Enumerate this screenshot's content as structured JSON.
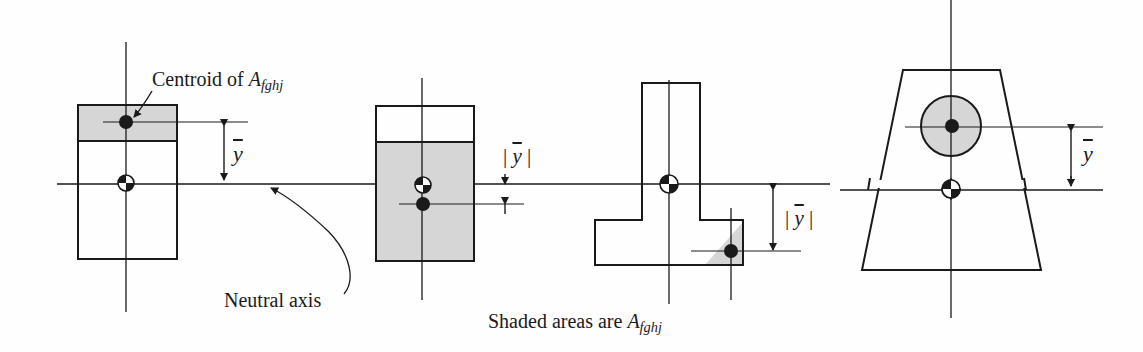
{
  "figure": {
    "caption": {
      "prefix": "Shaded areas are ",
      "symbol": "A",
      "subscript": "fghj"
    },
    "labels": {
      "centroid": {
        "prefix": "Centroid of ",
        "symbol": "A",
        "subscript": "fghj"
      },
      "neutral_axis": "Neutral axis",
      "ybar": "y",
      "abs_open": "|",
      "abs_close": "|"
    },
    "panels": [
      {
        "id": "rectangle-top-shaded",
        "shape": "rectangle",
        "shaded_region": "top strip",
        "dimension_label": "ȳ",
        "absolute": false
      },
      {
        "id": "rectangle-bottom-shaded",
        "shape": "rectangle",
        "shaded_region": "lower portion",
        "dimension_label": "|ȳ|",
        "absolute": true
      },
      {
        "id": "tee-corner-shaded",
        "shape": "inverted T",
        "shaded_region": "corner triangle",
        "dimension_label": "|ȳ|",
        "absolute": true
      },
      {
        "id": "trapezoid-circle-shaded",
        "shape": "trapezoid",
        "shaded_region": "circle",
        "dimension_label": "ȳ",
        "absolute": false
      }
    ],
    "colors": {
      "line": "#1a1a1a",
      "shade": "#d6d6d6",
      "background": "#fefefe"
    }
  }
}
